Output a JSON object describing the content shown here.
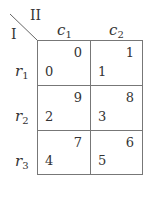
{
  "players": {
    "row_player": "I",
    "col_player": "II"
  },
  "columns": [
    {
      "name": "c",
      "sub": "1"
    },
    {
      "name": "c",
      "sub": "2"
    }
  ],
  "rows": [
    {
      "name": "r",
      "sub": "1",
      "cells": [
        {
          "top": "0",
          "bottom": "0"
        },
        {
          "top": "1",
          "bottom": "1"
        }
      ]
    },
    {
      "name": "r",
      "sub": "2",
      "cells": [
        {
          "top": "9",
          "bottom": "2"
        },
        {
          "top": "8",
          "bottom": "3"
        }
      ]
    },
    {
      "name": "r",
      "sub": "3",
      "cells": [
        {
          "top": "7",
          "bottom": "4"
        },
        {
          "top": "6",
          "bottom": "5"
        }
      ]
    }
  ],
  "colors": {
    "line": "#777777",
    "text": "#333333"
  }
}
